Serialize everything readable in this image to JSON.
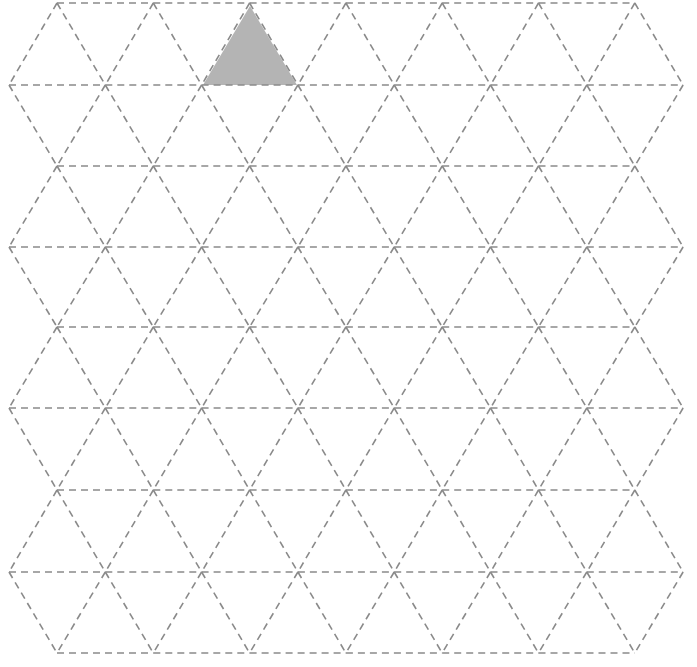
{
  "diagram": {
    "type": "isometric-triangle-grid",
    "rows": 9,
    "row_y": [
      3,
      85,
      166,
      247,
      327,
      408,
      490,
      572,
      653
    ],
    "even_row_x_start": 57,
    "odd_row_x_start": 9,
    "spacing": 96.3,
    "even_row_vertex_count": 7,
    "odd_row_vertex_count": 8,
    "line_color": "#8a8a8a",
    "line_style": "dashed",
    "shaded_triangle": {
      "points": [
        [
          250,
          6
        ],
        [
          203,
          85
        ],
        [
          297,
          85
        ]
      ],
      "fill": "#b4b4b4"
    }
  },
  "caption": ""
}
